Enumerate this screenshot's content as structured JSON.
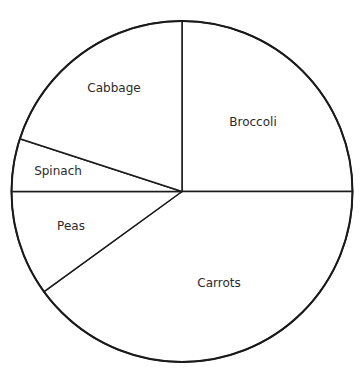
{
  "chart_data": {
    "type": "pie",
    "title": "",
    "categories": [
      "Broccoli",
      "Carrots",
      "Peas",
      "Spinach",
      "Cabbage"
    ],
    "values": [
      25,
      40,
      10,
      5,
      20
    ],
    "unit": "%",
    "start_angle_deg": 90,
    "direction": "clockwise",
    "legend": "none",
    "labels_inside": true,
    "stroke_color": "#1a1a1a",
    "fill_color": "#ffffff"
  },
  "labels": {
    "broccoli": "Broccoli",
    "carrots": "Carrots",
    "peas": "Peas",
    "spinach": "Spinach",
    "cabbage": "Cabbage"
  }
}
